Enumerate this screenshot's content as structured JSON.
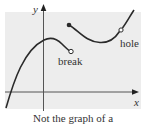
{
  "figure": {
    "axis_labels": {
      "x": "x",
      "y": "y"
    },
    "annotations": {
      "break": "break",
      "hole": "hole"
    },
    "caption": "Not the graph of a",
    "colors": {
      "background_shade": "#ededed",
      "curve": "#2a2a2a",
      "axis": "#444444",
      "text": "#333333"
    }
  }
}
